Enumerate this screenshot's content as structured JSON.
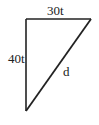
{
  "diagram": {
    "type": "right-triangle",
    "labels": {
      "top_side": "30t",
      "left_side": "40t",
      "hypotenuse": "d"
    },
    "colors": {
      "stroke": "#222222",
      "text": "#222222",
      "background": "#ffffff"
    }
  }
}
